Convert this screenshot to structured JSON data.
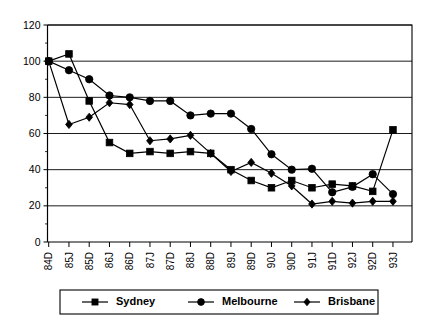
{
  "chart_data": {
    "type": "line",
    "title": "",
    "subtitle": "",
    "xlabel": "",
    "ylabel": "",
    "categories": [
      "84D",
      "85J",
      "85D",
      "86J",
      "86D",
      "87J",
      "87D",
      "88J",
      "88D",
      "89J",
      "89D",
      "90J",
      "90D",
      "91J",
      "91D",
      "92J",
      "92D",
      "93J"
    ],
    "ylim": [
      0,
      120
    ],
    "yticks": [
      0,
      20,
      40,
      60,
      80,
      100,
      120
    ],
    "ytick_labels": [
      "0",
      "20",
      "40",
      "60",
      "80",
      "100",
      "120"
    ],
    "grid": true,
    "grid_axis": "y",
    "legend_position": "bottom",
    "series": [
      {
        "name": "Sydney",
        "marker": "square",
        "values": [
          100,
          104,
          78,
          55,
          49,
          50,
          49,
          50,
          49,
          40,
          34,
          30,
          34,
          30,
          32,
          31,
          28,
          62
        ]
      },
      {
        "name": "Melbourne",
        "marker": "circle",
        "values": [
          100,
          95,
          90,
          81,
          80,
          78,
          78,
          70,
          71,
          71,
          62.5,
          48.5,
          40,
          40.5,
          27.5,
          30.5,
          37.5,
          26.5
        ]
      },
      {
        "name": "Brisbane",
        "marker": "diamond",
        "values": [
          100,
          65,
          69,
          77,
          76,
          56,
          57,
          59,
          49,
          39,
          44,
          38,
          31,
          21,
          22.5,
          21.5,
          22.5,
          22.5
        ]
      }
    ]
  },
  "legend": {
    "items": [
      {
        "label": "Sydney",
        "marker": "square"
      },
      {
        "label": "Melbourne",
        "marker": "circle"
      },
      {
        "label": "Brisbane",
        "marker": "diamond"
      }
    ]
  },
  "colors": {
    "series": "#000000",
    "grid": "#000000",
    "axis": "#000000",
    "background": "#ffffff"
  }
}
